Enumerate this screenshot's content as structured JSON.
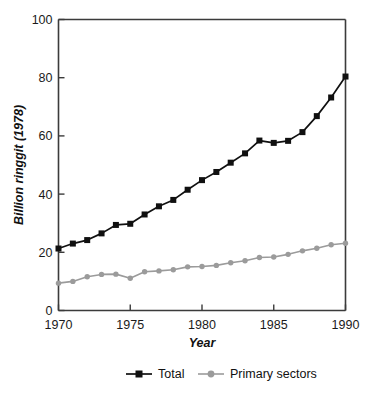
{
  "chart_data": {
    "type": "line",
    "title": "",
    "xlabel": "Year",
    "ylabel": "Billion ringgit (1978)",
    "xlim": [
      1970,
      1990
    ],
    "ylim": [
      0,
      100
    ],
    "grid": false,
    "legend_position": "bottom",
    "x": [
      1970,
      1971,
      1972,
      1973,
      1974,
      1975,
      1976,
      1977,
      1978,
      1979,
      1980,
      1981,
      1982,
      1983,
      1984,
      1985,
      1986,
      1987,
      1988,
      1989,
      1990
    ],
    "xticks": [
      "1970",
      "1975",
      "1980",
      "1985",
      "1990"
    ],
    "xtick_values": [
      1970,
      1975,
      1980,
      1985,
      1990
    ],
    "yticks": [
      "0",
      "20",
      "40",
      "60",
      "80",
      "100"
    ],
    "ytick_values": [
      0,
      20,
      40,
      60,
      80,
      100
    ],
    "series": [
      {
        "name": "Total",
        "color": "#101010",
        "marker": "square",
        "values": [
          21.3,
          23.0,
          24.2,
          26.5,
          29.4,
          29.8,
          33.0,
          35.8,
          38.0,
          41.5,
          44.8,
          47.6,
          50.8,
          54.0,
          58.4,
          57.6,
          58.3,
          61.3,
          66.8,
          73.2,
          80.4
        ]
      },
      {
        "name": "Primary sectors",
        "color": "#9b9b9b",
        "marker": "circle",
        "values": [
          9.4,
          10.0,
          11.6,
          12.4,
          12.5,
          11.1,
          13.3,
          13.6,
          14.0,
          15.0,
          15.1,
          15.5,
          16.4,
          17.1,
          18.2,
          18.4,
          19.3,
          20.5,
          21.4,
          22.6,
          23.1
        ]
      }
    ]
  },
  "legend": {
    "items": [
      {
        "label": "Total"
      },
      {
        "label": "Primary sectors"
      }
    ]
  }
}
